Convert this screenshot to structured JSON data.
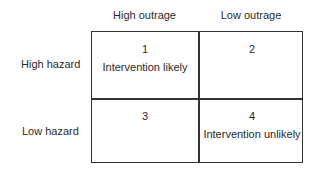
{
  "columns": [
    "High outrage",
    "Low outrage"
  ],
  "rows": [
    "High hazard",
    "Low hazard"
  ],
  "cells": [
    {
      "number": "1",
      "note": "Intervention likely"
    },
    {
      "number": "2",
      "note": ""
    },
    {
      "number": "3",
      "note": ""
    },
    {
      "number": "4",
      "note": "Intervention unlikely"
    }
  ]
}
